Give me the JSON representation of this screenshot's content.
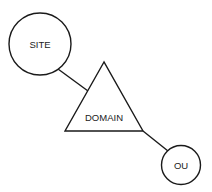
{
  "diagram": {
    "nodes": [
      {
        "id": "site",
        "label": "SITE",
        "shape": "circle"
      },
      {
        "id": "domain",
        "label": "DOMAIN",
        "shape": "triangle"
      },
      {
        "id": "ou",
        "label": "OU",
        "shape": "circle"
      }
    ],
    "edges": [
      {
        "from": "site",
        "to": "domain"
      },
      {
        "from": "domain",
        "to": "ou"
      }
    ],
    "colors": {
      "stroke": "#1a1a1a",
      "fill": "#ffffff",
      "text": "#222222"
    }
  }
}
